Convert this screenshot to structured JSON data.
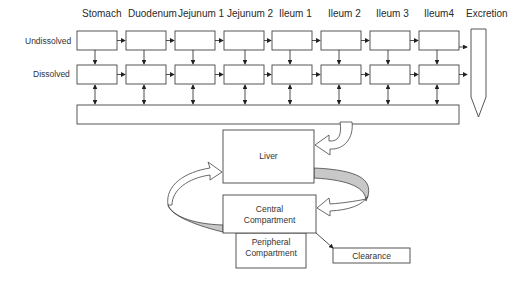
{
  "segments": [
    "Stomach",
    "Duodenum",
    "Jejunum 1",
    "Jejunum 2",
    "Ileum 1",
    "Ileum 2",
    "Ileum 3",
    "Ileum4"
  ],
  "excretion_label": "Excretion",
  "rows": {
    "undissolved": "Undissolved",
    "dissolved": "Dissolved"
  },
  "liver": "Liver",
  "central": {
    "line1": "Central",
    "line2": "Compartment"
  },
  "peripheral": {
    "line1": "Peripheral",
    "line2": "Compartment"
  },
  "clearance": "Clearance",
  "colors": {
    "stroke": "#333333",
    "band": "#c8c8c8",
    "background": "#ffffff"
  }
}
